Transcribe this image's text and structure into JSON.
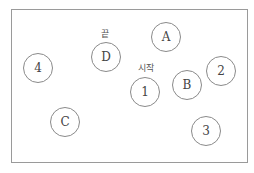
{
  "diagram": {
    "frame": {
      "border_color": "#9a9a9a"
    },
    "nodes": [
      {
        "id": "4",
        "label": "4",
        "cx": 38,
        "cy": 68
      },
      {
        "id": "D",
        "label": "D",
        "cx": 106,
        "cy": 57
      },
      {
        "id": "A",
        "label": "A",
        "cx": 166,
        "cy": 37
      },
      {
        "id": "2",
        "label": "2",
        "cx": 221,
        "cy": 71
      },
      {
        "id": "B",
        "label": "B",
        "cx": 187,
        "cy": 85
      },
      {
        "id": "1",
        "label": "1",
        "cx": 145,
        "cy": 92
      },
      {
        "id": "C",
        "label": "C",
        "cx": 65,
        "cy": 122
      },
      {
        "id": "3",
        "label": "3",
        "cx": 206,
        "cy": 131
      }
    ],
    "annotations": [
      {
        "text": "끝",
        "target": "D",
        "x": 105,
        "y": 28
      },
      {
        "text": "시작",
        "target": "1",
        "x": 146,
        "y": 62
      }
    ]
  }
}
